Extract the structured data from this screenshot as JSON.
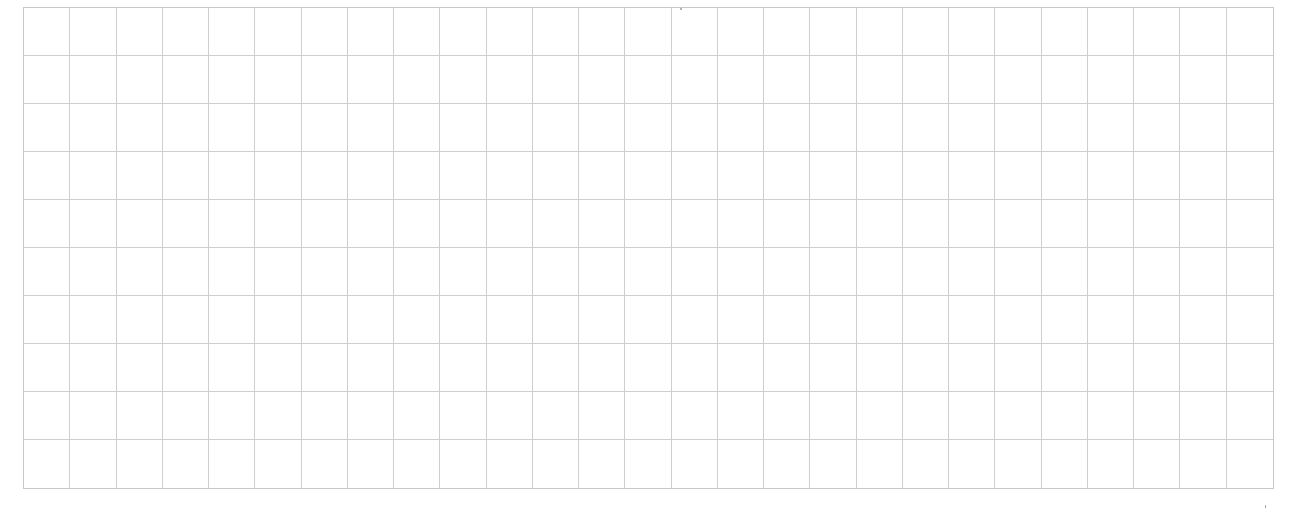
{
  "sheet": {
    "type": "grid-paper",
    "columns": 27,
    "rows": 10,
    "line_color": "#cfcfcf",
    "background_color": "#ffffff"
  }
}
